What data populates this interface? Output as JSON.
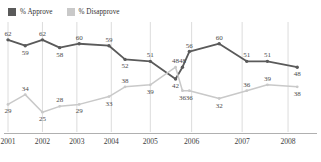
{
  "legend": {
    "position": "top-left",
    "items": [
      {
        "label": "% Approve",
        "color": "#5a5a5a",
        "icon": "square-swatch"
      },
      {
        "label": "% Disapprove",
        "color": "#c9c9c9",
        "icon": "square-swatch"
      }
    ]
  },
  "chart_data": {
    "type": "line",
    "title": "",
    "subtitle": "",
    "xlabel": "",
    "ylabel": "",
    "ylim": [
      20,
      66
    ],
    "grid": true,
    "grid_orientation": "vertical",
    "legend_position": "top-left",
    "x_tick_labels": [
      "2001",
      "2002",
      "2003",
      "2004",
      "2005",
      "2006",
      "2007",
      "2008"
    ],
    "x_positions": [
      0,
      1.5,
      3,
      4.5,
      6.2,
      8,
      10.2,
      12.2
    ],
    "x": [
      0,
      0.75,
      1.5,
      2.25,
      3.1,
      4.4,
      5.1,
      6.2,
      7.3,
      7.6,
      7.9,
      9.2,
      10.4,
      11.3,
      12.6
    ],
    "series": [
      {
        "name": "% Approve",
        "color": "#5a5a5a",
        "values": [
          62,
          59,
          62,
          58,
          60,
          59,
          52,
          51,
          42,
          48,
          56,
          60,
          51,
          51,
          48
        ],
        "labels": [
          "62",
          "59",
          "62",
          "58",
          "60",
          "59",
          "52",
          "51",
          "42",
          "48",
          "56",
          "60",
          "51",
          "51",
          "48"
        ],
        "label_side": [
          "above",
          "below",
          "above",
          "below",
          "above",
          "above",
          "below",
          "above",
          "below",
          "above",
          "above",
          "above",
          "above",
          "above",
          "below"
        ]
      },
      {
        "name": "% Disapprove",
        "color": "#c9c9c9",
        "values": [
          29,
          34,
          25,
          28,
          29,
          33,
          38,
          39,
          48,
          36,
          36,
          32,
          36,
          39,
          38
        ],
        "labels": [
          "29",
          "34",
          "25",
          "28",
          "29",
          "33",
          "38",
          "39",
          "48",
          "36",
          "36",
          "32",
          "36",
          "39",
          "38"
        ],
        "label_side": [
          "below",
          "above",
          "below",
          "above",
          "below",
          "below",
          "above",
          "below",
          "above",
          "below",
          "below",
          "below",
          "above",
          "above",
          "below"
        ]
      }
    ]
  }
}
